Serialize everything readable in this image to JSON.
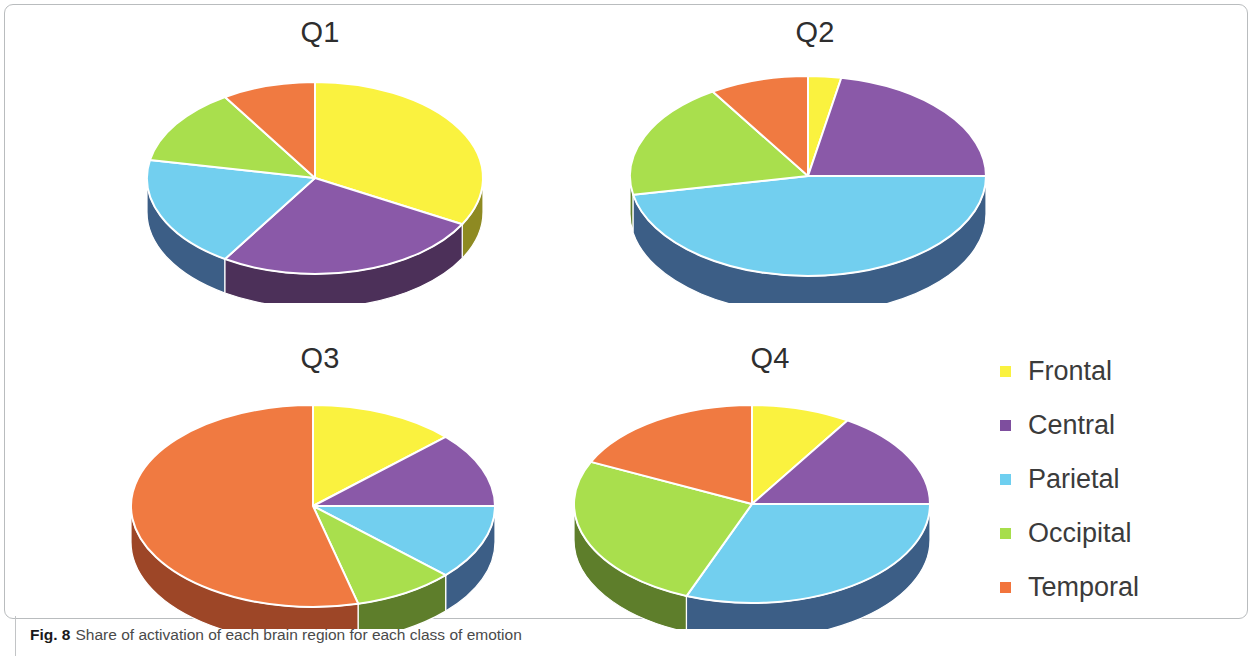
{
  "figure": {
    "caption_label": "Fig. 8",
    "caption_text": "Share of activation of each brain region for each class of emotion"
  },
  "legend": {
    "position": "right",
    "items": [
      {
        "label": "Frontal",
        "color": "#FAF23F"
      },
      {
        "label": "Central",
        "color": "#7E4E9E"
      },
      {
        "label": "Parietal",
        "color": "#6ECFF0"
      },
      {
        "label": "Occipital",
        "color": "#A7DE4B"
      },
      {
        "label": "Temporal",
        "color": "#F2743C"
      }
    ]
  },
  "colors": {
    "frontal": "#FAF23F",
    "central": "#8A59A8",
    "parietal": "#72CFEF",
    "occipital": "#A9DF4D",
    "temporal": "#F07A41",
    "frontal_side": "#8E8A22",
    "central_side": "#4C3059",
    "parietal_side": "#3C5E86",
    "occipital_side": "#5E7E2B",
    "temporal_side": "#9D4627",
    "title_color": "#2e2e2e",
    "border_color": "#b9bcbe"
  },
  "chart_data": [
    {
      "type": "pie",
      "title": "Q1",
      "categories": [
        "Frontal",
        "Central",
        "Parietal",
        "Occipital",
        "Temporal"
      ],
      "values": [
        33,
        26,
        19,
        13,
        9
      ],
      "unit": "percent",
      "start_angle_deg": 0,
      "direction": "clockwise",
      "three_d": true,
      "legend": "shared-right"
    },
    {
      "type": "pie",
      "title": "Q2",
      "categories": [
        "Frontal",
        "Central",
        "Parietal",
        "Occipital",
        "Temporal"
      ],
      "values": [
        3,
        22,
        47,
        19,
        9
      ],
      "unit": "percent",
      "start_angle_deg": 0,
      "direction": "clockwise",
      "three_d": true,
      "legend": "shared-right"
    },
    {
      "type": "pie",
      "title": "Q3",
      "categories": [
        "Frontal",
        "Central",
        "Parietal",
        "Occipital",
        "Temporal"
      ],
      "values": [
        13,
        12,
        12,
        9,
        54
      ],
      "unit": "percent",
      "start_angle_deg": 0,
      "direction": "clockwise",
      "three_d": true,
      "legend": "shared-right"
    },
    {
      "type": "pie",
      "title": "Q4",
      "categories": [
        "Frontal",
        "Central",
        "Parietal",
        "Occipital",
        "Temporal"
      ],
      "values": [
        9,
        16,
        31,
        26,
        18
      ],
      "unit": "percent",
      "start_angle_deg": 0,
      "direction": "clockwise",
      "three_d": true,
      "legend": "shared-right"
    }
  ],
  "layout": {
    "pies": [
      {
        "key": "Q1",
        "left": 120,
        "top": 18,
        "width": 400,
        "height": 285,
        "cx": 195,
        "cy": 118,
        "rx": 168,
        "ry": 96,
        "depth": 34
      },
      {
        "key": "Q2",
        "left": 600,
        "top": 18,
        "width": 430,
        "height": 285,
        "cx": 208,
        "cy": 116,
        "rx": 178,
        "ry": 100,
        "depth": 38
      },
      {
        "key": "Q3",
        "left": 110,
        "top": 344,
        "width": 420,
        "height": 285,
        "cx": 203,
        "cy": 120,
        "rx": 182,
        "ry": 101,
        "depth": 36
      },
      {
        "key": "Q4",
        "left": 560,
        "top": 344,
        "width": 420,
        "height": 285,
        "cx": 192,
        "cy": 118,
        "rx": 178,
        "ry": 99,
        "depth": 36
      }
    ]
  }
}
